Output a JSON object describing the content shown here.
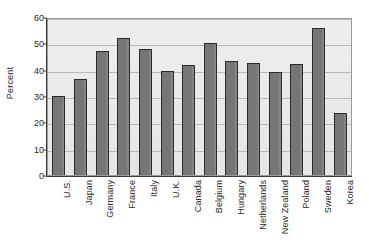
{
  "chart_data": {
    "type": "bar",
    "title": "",
    "xlabel": "",
    "ylabel": "Percent",
    "ylim": [
      0,
      60
    ],
    "ytick_values": [
      0,
      10,
      20,
      30,
      40,
      50,
      60
    ],
    "ytick_labels": [
      "0",
      "10",
      "20",
      "30",
      "40",
      "50",
      "60"
    ],
    "grid": true,
    "legend": "none",
    "categories": [
      "U.S.",
      "Japan",
      "Germany",
      "France",
      "Italy",
      "U.K.",
      "Canada",
      "Belgium",
      "Hungary",
      "Netherlands",
      "New Zealand",
      "Poland",
      "Sweden",
      "Korea"
    ],
    "values": [
      30.0,
      36.5,
      47.0,
      52.0,
      48.0,
      39.5,
      41.7,
      50.3,
      43.3,
      42.5,
      39.2,
      42.2,
      55.7,
      23.5
    ],
    "bar_color": "#767676",
    "bar_edge_color": "#2b2b2b",
    "plot_background": "#e9e9e9",
    "gridline_color": "#b9b9b9",
    "axis_color": "#3a3a3a"
  }
}
